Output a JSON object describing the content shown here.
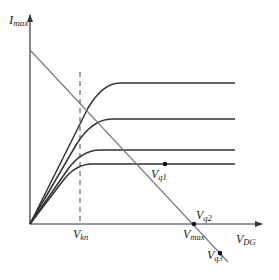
{
  "diagram": {
    "type": "transistor output characteristics with load line",
    "axes": {
      "y_label_main": "I",
      "y_label_sub": "max",
      "x_label_main": "V",
      "x_label_sub": "DG"
    },
    "markers": {
      "knee_main": "V",
      "knee_sub": "kn",
      "vmax_main": "V",
      "vmax_sub": "max"
    },
    "points": [
      {
        "id": "q1",
        "label_main": "V",
        "label_sub": "q1"
      },
      {
        "id": "q2",
        "label_main": "V",
        "label_sub": "q2"
      },
      {
        "id": "q3",
        "label_main": "V",
        "label_sub": "q3"
      }
    ],
    "curves_count": 4,
    "colors": {
      "curve": "#333333",
      "axis": "#333333",
      "load_line": "#777777",
      "dashed": "#444444"
    }
  }
}
